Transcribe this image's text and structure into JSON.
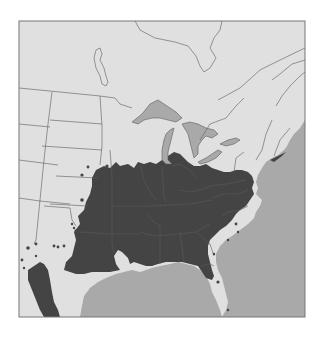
{
  "map": {
    "title": "Species distribution range map — eastern North America",
    "legend_hidden_label": "Native range (dark shading)",
    "colors": {
      "background": "#ffffff",
      "land": "#e0e0e0",
      "water": "#a9a9a9",
      "range": "#444444",
      "border": "#5a5a5a",
      "frame": "#777777"
    },
    "frame": {
      "x": 19,
      "y": 21,
      "width": 286,
      "height": 296
    },
    "regions": [
      {
        "name": "great-lakes",
        "label": "Great Lakes"
      },
      {
        "name": "atlantic-ocean",
        "label": "Atlantic Ocean"
      },
      {
        "name": "gulf-of-mexico",
        "label": "Gulf of Mexico"
      },
      {
        "name": "main-range",
        "label": "Eastern US continuous range"
      },
      {
        "name": "mexico-range",
        "label": "Northeastern Mexico range"
      }
    ],
    "outlier_points_count": 22
  }
}
